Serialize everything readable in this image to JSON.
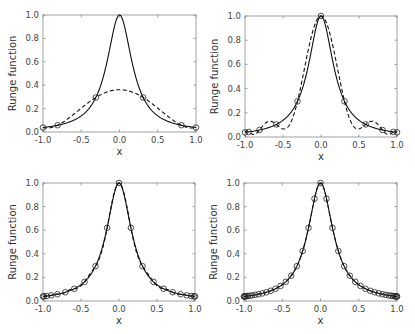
{
  "figure": {
    "function_label": "Runge function",
    "x_label": "x",
    "x_ticks": [
      "-1.0",
      "-0.5",
      "0.0",
      "0.5",
      "1.0"
    ],
    "y_ticks": [
      "0.0",
      "0.2",
      "0.4",
      "0.6",
      "0.8",
      "1.0"
    ]
  },
  "chart_data": [
    {
      "type": "line",
      "title": "",
      "xlabel": "x",
      "ylabel": "Runge function",
      "xlim": [
        -1.0,
        1.0
      ],
      "ylim": [
        0.0,
        1.0
      ],
      "grid": false,
      "series": [
        {
          "name": "Runge function 1/(1+25x^2)",
          "style": "solid"
        },
        {
          "name": "Interpolant",
          "style": "dashed"
        },
        {
          "name": "Nodes",
          "style": "circle-markers"
        }
      ],
      "nodes_x": [
        -1.0,
        -0.809,
        -0.309,
        0.309,
        0.809,
        1.0
      ],
      "nodes_y": [
        0.038,
        0.058,
        0.295,
        0.295,
        0.058,
        0.038
      ],
      "interpolant_peak_y": 0.35,
      "box": {
        "left": 43,
        "top": 15,
        "right": 196,
        "bottom": 132
      }
    },
    {
      "type": "line",
      "title": "",
      "xlabel": "x",
      "ylabel": "Runge function",
      "xlim": [
        -1.0,
        1.0
      ],
      "ylim": [
        0.0,
        1.0
      ],
      "grid": false,
      "series": [
        {
          "name": "Runge function 1/(1+25x^2)",
          "style": "solid"
        },
        {
          "name": "Interpolant",
          "style": "dashed"
        },
        {
          "name": "Nodes",
          "style": "circle-markers"
        }
      ],
      "nodes_x": [
        -1.0,
        -0.951,
        -0.809,
        -0.588,
        -0.309,
        0.0,
        0.309,
        0.588,
        0.809,
        0.951,
        1.0
      ],
      "nodes_y": [
        0.038,
        0.042,
        0.058,
        0.104,
        0.295,
        1.0,
        0.295,
        0.104,
        0.058,
        0.042,
        0.038
      ],
      "box": {
        "left": 245,
        "top": 16,
        "right": 397,
        "bottom": 137
      }
    },
    {
      "type": "line",
      "title": "",
      "xlabel": "x",
      "ylabel": "Runge function",
      "xlim": [
        -1.0,
        1.0
      ],
      "ylim": [
        0.0,
        1.0
      ],
      "grid": false,
      "series": [
        {
          "name": "Runge function 1/(1+25x^2)",
          "style": "solid"
        },
        {
          "name": "Interpolant",
          "style": "dashed"
        },
        {
          "name": "Nodes",
          "style": "circle-markers"
        }
      ],
      "node_count": 21,
      "nodes_rule": "cos(k*pi/20), k=0..20",
      "box": {
        "left": 43,
        "top": 183,
        "right": 195,
        "bottom": 301
      }
    },
    {
      "type": "line",
      "title": "",
      "xlabel": "x",
      "ylabel": "Runge function",
      "xlim": [
        -1.0,
        1.0
      ],
      "ylim": [
        0.0,
        1.0
      ],
      "grid": false,
      "series": [
        {
          "name": "Runge function 1/(1+25x^2)",
          "style": "solid"
        },
        {
          "name": "Interpolant",
          "style": "dashed"
        },
        {
          "name": "Nodes",
          "style": "circle-markers"
        }
      ],
      "node_count": 41,
      "nodes_rule": "cos(k*pi/40), k=0..40",
      "box": {
        "left": 244,
        "top": 183,
        "right": 397,
        "bottom": 301
      }
    }
  ]
}
